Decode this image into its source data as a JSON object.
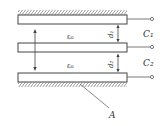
{
  "diagram": {
    "labels": {
      "eps_top": "ε₀",
      "eps_bottom": "ε₀",
      "d1": "d₁",
      "d2": "d₂",
      "c1": "C₁",
      "c2": "C₂",
      "area": "A"
    },
    "plates": [
      {
        "name": "top",
        "fixed": true
      },
      {
        "name": "middle",
        "fixed": false
      },
      {
        "name": "bottom",
        "fixed": true
      }
    ],
    "colors": {
      "stroke": "#444444",
      "background": "#ffffff"
    }
  }
}
